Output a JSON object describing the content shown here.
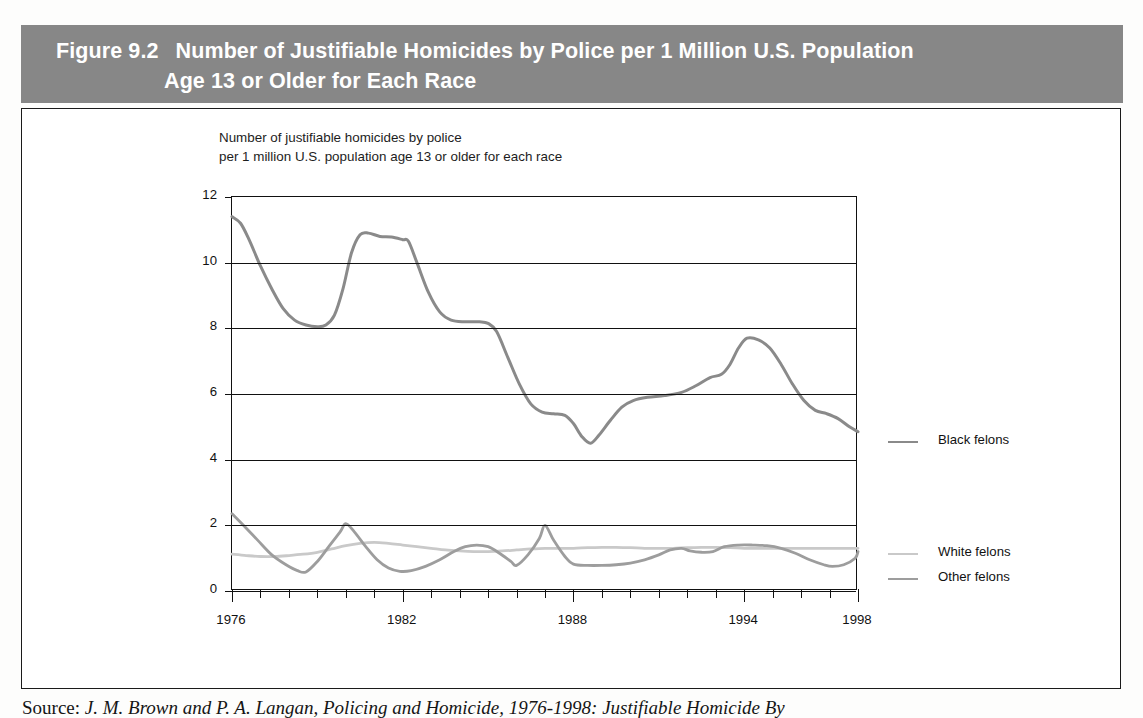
{
  "figure": {
    "label": "Figure 9.2",
    "title_line1": "Number of Justifiable Homicides by Police per 1 Million U.S. Population",
    "title_line2": "Age 13 or Older for Each Race",
    "header_bg": "#878787",
    "header_text_color": "#ffffff"
  },
  "subtitle": "Number of justifiable homicides by police\nper 1 million U.S. population age 13 or older for each race",
  "source": {
    "lead": "Source:",
    "text": "J. M. Brown and P. A. Langan, Policing and Homicide, 1976-1998: Justifiable Homicide By"
  },
  "legend": {
    "position": "right",
    "items": [
      {
        "label": "Black felons",
        "color": "#8a8a8a"
      },
      {
        "label": "White felons",
        "color": "#c9c9c9"
      },
      {
        "label": "Other felons",
        "color": "#9d9d9d"
      }
    ]
  },
  "chart_data": {
    "type": "line",
    "title": "Number of Justifiable Homicides by Police per 1 Million U.S. Population Age 13 or Older for Each Race",
    "subtitle": "Number of justifiable homicides by police per 1 million U.S. population age 13 or older for each race",
    "xlabel": "",
    "ylabel": "Number of justifiable homicides by police per 1 million U.S. population age 13 or older for each race",
    "x": [
      1976,
      1977,
      1978,
      1979,
      1980,
      1981,
      1982,
      1983,
      1984,
      1985,
      1986,
      1987,
      1988,
      1989,
      1990,
      1991,
      1992,
      1993,
      1994,
      1995,
      1996,
      1997,
      1998
    ],
    "xlim": [
      1976,
      1998
    ],
    "ylim": [
      0,
      12
    ],
    "xticks": [
      1976,
      1977,
      1978,
      1979,
      1980,
      1981,
      1982,
      1983,
      1984,
      1985,
      1986,
      1987,
      1988,
      1989,
      1990,
      1991,
      1992,
      1993,
      1994,
      1995,
      1996,
      1997,
      1998
    ],
    "xticklabels": [
      "1976",
      "",
      "",
      "",
      "",
      "",
      "1982",
      "",
      "",
      "",
      "",
      "",
      "1988",
      "",
      "",
      "",
      "",
      "",
      "1994",
      "",
      "",
      "",
      "1998"
    ],
    "xtick_labeled": [
      1976,
      1982,
      1988,
      1994,
      1998
    ],
    "yticks": [
      0,
      2,
      4,
      6,
      8,
      10,
      12
    ],
    "yticklabels": [
      "0",
      "2",
      "4",
      "6",
      "8",
      "10",
      "12"
    ],
    "grid": "horizontal",
    "series": [
      {
        "name": "Black felons",
        "color": "#8a8a8a",
        "values": [
          11.4,
          9.6,
          8.3,
          8.1,
          9.1,
          10.9,
          10.8,
          10.7,
          9.0,
          8.3,
          8.2,
          8.1,
          6.5,
          5.5,
          5.4,
          5.1,
          4.5,
          5.3,
          5.8,
          6.0,
          6.1,
          6.5,
          6.7
        ]
      },
      {
        "name": "White felons",
        "color": "#c9c9c9",
        "values": [
          1.15,
          1.1,
          1.1,
          1.15,
          1.25,
          1.3,
          1.35,
          1.4,
          1.4,
          1.35,
          1.3,
          1.25,
          1.2,
          1.25,
          1.3,
          1.3,
          1.3,
          1.3,
          1.3,
          1.3,
          1.3,
          1.25,
          1.2
        ]
      },
      {
        "name": "Other felons",
        "color": "#9d9d9d",
        "values": [
          2.35,
          1.85,
          1.35,
          0.6,
          1.35,
          2.05,
          1.5,
          0.6,
          0.7,
          0.95,
          1.35,
          2.0,
          0.85,
          0.8,
          0.85,
          1.1,
          1.25,
          1.2,
          1.3,
          1.35,
          1.3,
          0.75,
          1.2
        ]
      }
    ],
    "series_full": {
      "note": "dense sampled paths used for rendering the hand-drawn curves",
      "black_felons": [
        [
          1976,
          11.4
        ],
        [
          1976.3,
          11.2
        ],
        [
          1976.6,
          10.7
        ],
        [
          1977,
          9.9
        ],
        [
          1977.4,
          9.2
        ],
        [
          1977.8,
          8.6
        ],
        [
          1978.2,
          8.25
        ],
        [
          1978.6,
          8.1
        ],
        [
          1979,
          8.05
        ],
        [
          1979.3,
          8.1
        ],
        [
          1979.6,
          8.4
        ],
        [
          1979.9,
          9.2
        ],
        [
          1980.2,
          10.3
        ],
        [
          1980.5,
          10.85
        ],
        [
          1980.8,
          10.9
        ],
        [
          1981.2,
          10.8
        ],
        [
          1981.6,
          10.78
        ],
        [
          1982,
          10.7
        ],
        [
          1982.2,
          10.65
        ],
        [
          1982.5,
          10.0
        ],
        [
          1982.9,
          9.1
        ],
        [
          1983.3,
          8.5
        ],
        [
          1983.7,
          8.25
        ],
        [
          1984.2,
          8.2
        ],
        [
          1984.7,
          8.2
        ],
        [
          1985,
          8.15
        ],
        [
          1985.3,
          7.9
        ],
        [
          1985.7,
          7.1
        ],
        [
          1986.1,
          6.3
        ],
        [
          1986.5,
          5.7
        ],
        [
          1986.9,
          5.45
        ],
        [
          1987.3,
          5.4
        ],
        [
          1987.7,
          5.35
        ],
        [
          1988,
          5.1
        ],
        [
          1988.3,
          4.7
        ],
        [
          1988.6,
          4.5
        ],
        [
          1988.9,
          4.75
        ],
        [
          1989.3,
          5.2
        ],
        [
          1989.7,
          5.6
        ],
        [
          1990.1,
          5.8
        ],
        [
          1990.6,
          5.9
        ],
        [
          1991.2,
          5.95
        ],
        [
          1991.8,
          6.05
        ],
        [
          1992.3,
          6.25
        ],
        [
          1992.8,
          6.5
        ],
        [
          1993.2,
          6.6
        ],
        [
          1993.5,
          6.9
        ],
        [
          1993.8,
          7.4
        ],
        [
          1994.1,
          7.7
        ],
        [
          1994.5,
          7.65
        ],
        [
          1994.9,
          7.4
        ],
        [
          1995.3,
          6.9
        ],
        [
          1995.7,
          6.3
        ],
        [
          1996.1,
          5.8
        ],
        [
          1996.5,
          5.5
        ],
        [
          1996.9,
          5.4
        ],
        [
          1997.3,
          5.25
        ],
        [
          1997.7,
          5.0
        ],
        [
          1998,
          4.85
        ]
      ],
      "white_felons": [
        [
          1976,
          1.12
        ],
        [
          1976.5,
          1.08
        ],
        [
          1977,
          1.05
        ],
        [
          1977.5,
          1.05
        ],
        [
          1978,
          1.08
        ],
        [
          1978.5,
          1.12
        ],
        [
          1979,
          1.18
        ],
        [
          1979.5,
          1.28
        ],
        [
          1980,
          1.38
        ],
        [
          1980.5,
          1.45
        ],
        [
          1981,
          1.48
        ],
        [
          1981.5,
          1.45
        ],
        [
          1982,
          1.4
        ],
        [
          1982.5,
          1.35
        ],
        [
          1983,
          1.3
        ],
        [
          1983.5,
          1.25
        ],
        [
          1984,
          1.22
        ],
        [
          1984.5,
          1.2
        ],
        [
          1985,
          1.2
        ],
        [
          1985.5,
          1.22
        ],
        [
          1986,
          1.25
        ],
        [
          1986.5,
          1.28
        ],
        [
          1987,
          1.3
        ],
        [
          1987.5,
          1.3
        ],
        [
          1988,
          1.3
        ],
        [
          1988.5,
          1.32
        ],
        [
          1989,
          1.33
        ],
        [
          1989.5,
          1.33
        ],
        [
          1990,
          1.32
        ],
        [
          1990.5,
          1.3
        ],
        [
          1991,
          1.3
        ],
        [
          1991.5,
          1.3
        ],
        [
          1992,
          1.32
        ],
        [
          1992.5,
          1.33
        ],
        [
          1993,
          1.33
        ],
        [
          1993.5,
          1.32
        ],
        [
          1994,
          1.3
        ],
        [
          1994.5,
          1.3
        ],
        [
          1995,
          1.3
        ],
        [
          1995.5,
          1.3
        ],
        [
          1996,
          1.3
        ],
        [
          1996.5,
          1.3
        ],
        [
          1997,
          1.3
        ],
        [
          1997.5,
          1.3
        ],
        [
          1998,
          1.3
        ]
      ],
      "other_felons": [
        [
          1976,
          2.35
        ],
        [
          1976.4,
          2.0
        ],
        [
          1976.9,
          1.55
        ],
        [
          1977.4,
          1.1
        ],
        [
          1977.9,
          0.8
        ],
        [
          1978.3,
          0.62
        ],
        [
          1978.6,
          0.58
        ],
        [
          1979,
          0.9
        ],
        [
          1979.4,
          1.35
        ],
        [
          1979.8,
          1.8
        ],
        [
          1980,
          2.05
        ],
        [
          1980.3,
          1.8
        ],
        [
          1980.7,
          1.35
        ],
        [
          1981.1,
          0.95
        ],
        [
          1981.5,
          0.7
        ],
        [
          1981.9,
          0.6
        ],
        [
          1982.3,
          0.62
        ],
        [
          1982.8,
          0.75
        ],
        [
          1983.3,
          0.95
        ],
        [
          1983.8,
          1.2
        ],
        [
          1984.2,
          1.35
        ],
        [
          1984.6,
          1.4
        ],
        [
          1985,
          1.35
        ],
        [
          1985.4,
          1.15
        ],
        [
          1985.8,
          0.9
        ],
        [
          1986,
          0.78
        ],
        [
          1986.4,
          1.1
        ],
        [
          1986.8,
          1.6
        ],
        [
          1987,
          2.0
        ],
        [
          1987.3,
          1.55
        ],
        [
          1987.7,
          1.05
        ],
        [
          1988,
          0.82
        ],
        [
          1988.5,
          0.78
        ],
        [
          1989,
          0.78
        ],
        [
          1989.5,
          0.8
        ],
        [
          1990,
          0.85
        ],
        [
          1990.5,
          0.95
        ],
        [
          1991,
          1.1
        ],
        [
          1991.4,
          1.25
        ],
        [
          1991.8,
          1.3
        ],
        [
          1992.1,
          1.22
        ],
        [
          1992.5,
          1.18
        ],
        [
          1992.9,
          1.2
        ],
        [
          1993.3,
          1.35
        ],
        [
          1993.8,
          1.4
        ],
        [
          1994.3,
          1.4
        ],
        [
          1994.8,
          1.38
        ],
        [
          1995.3,
          1.3
        ],
        [
          1995.8,
          1.15
        ],
        [
          1996.3,
          0.95
        ],
        [
          1996.8,
          0.8
        ],
        [
          1997.1,
          0.75
        ],
        [
          1997.5,
          0.8
        ],
        [
          1997.9,
          1.0
        ],
        [
          1998,
          1.2
        ]
      ]
    }
  }
}
